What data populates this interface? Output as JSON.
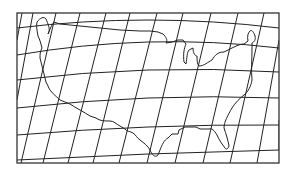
{
  "map": {
    "subject": "Contiguous United States",
    "projection": "conic",
    "colors": {
      "background": "#ffffff",
      "graticule": "#222222",
      "outline": "#222222",
      "frame": "#333333"
    },
    "frame": {
      "x": 17,
      "y": 13,
      "width": 262,
      "height": 150
    },
    "meridians": [
      {
        "top": [
          22,
          13
        ],
        "bottom": [
          17,
          40
        ]
      },
      {
        "top": [
          33,
          13
        ],
        "bottom": [
          17,
          100
        ]
      },
      {
        "top": [
          56,
          13
        ],
        "bottom": [
          21,
          163
        ]
      },
      {
        "top": [
          80,
          13
        ],
        "bottom": [
          43,
          163
        ]
      },
      {
        "top": [
          106,
          13
        ],
        "bottom": [
          68,
          163
        ]
      },
      {
        "top": [
          130,
          13
        ],
        "bottom": [
          93,
          163
        ]
      },
      {
        "top": [
          157,
          13
        ],
        "bottom": [
          119,
          163
        ]
      },
      {
        "top": [
          183,
          13
        ],
        "bottom": [
          147,
          163
        ]
      },
      {
        "top": [
          211,
          13
        ],
        "bottom": [
          175,
          163
        ]
      },
      {
        "top": [
          238,
          13
        ],
        "bottom": [
          203,
          163
        ]
      },
      {
        "top": [
          264,
          13
        ],
        "bottom": [
          230,
          163
        ]
      },
      {
        "top": [
          279,
          40
        ],
        "bottom": [
          257,
          163
        ]
      },
      {
        "top": [
          279,
          120
        ],
        "bottom": [
          279,
          150
        ]
      }
    ],
    "parallels": [
      {
        "left": [
          17,
          28
        ],
        "mid": [
          148,
          20
        ],
        "right": [
          279,
          28
        ]
      },
      {
        "left": [
          17,
          55
        ],
        "mid": [
          148,
          42
        ],
        "right": [
          279,
          48
        ]
      },
      {
        "left": [
          17,
          80
        ],
        "mid": [
          148,
          70
        ],
        "right": [
          279,
          72
        ]
      },
      {
        "left": [
          17,
          108
        ],
        "mid": [
          148,
          98
        ],
        "right": [
          279,
          98
        ]
      },
      {
        "left": [
          17,
          135
        ],
        "mid": [
          148,
          127
        ],
        "right": [
          279,
          125
        ]
      },
      {
        "left": [
          17,
          160
        ],
        "mid": [
          148,
          154
        ],
        "right": [
          279,
          150
        ]
      }
    ]
  }
}
